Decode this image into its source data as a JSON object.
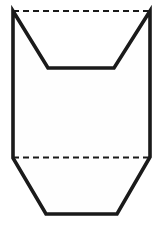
{
  "document": {
    "title": "Net / Unfolded Solid Line Drawing",
    "background_color": "#ffffff"
  },
  "figure": {
    "name": "hexagonal-net-outline",
    "canvas": {
      "width": 163,
      "height": 230
    },
    "stroke_color": "#1a1a1a",
    "fill_color": "#fefefe",
    "solid_stroke_width": 3.6,
    "dashed_stroke_width": 2.0,
    "dash_pattern": "6,4",
    "solid_outline_points": "13,11 48,68 114,68 150,11 150,157 117,214 46,214 13,158",
    "fold_lines": [
      {
        "name": "top-fold-line",
        "x1": 13,
        "y1": 11,
        "x2": 150,
        "y2": 11,
        "style": "dashed"
      },
      {
        "name": "bottom-fold-line",
        "x1": 13,
        "y1": 157.5,
        "x2": 150,
        "y2": 157.5,
        "style": "dashed"
      }
    ],
    "vertices": [
      {
        "name": "top-left-peak",
        "x": 13,
        "y": 11
      },
      {
        "name": "notch-bottom-left",
        "x": 48,
        "y": 68
      },
      {
        "name": "notch-bottom-right",
        "x": 114,
        "y": 68
      },
      {
        "name": "top-right-peak",
        "x": 150,
        "y": 11
      },
      {
        "name": "right-fold-corner",
        "x": 150,
        "y": 157
      },
      {
        "name": "bottom-right-corner",
        "x": 117,
        "y": 214
      },
      {
        "name": "bottom-left-corner",
        "x": 46,
        "y": 214
      },
      {
        "name": "left-fold-corner",
        "x": 13,
        "y": 158
      }
    ]
  }
}
